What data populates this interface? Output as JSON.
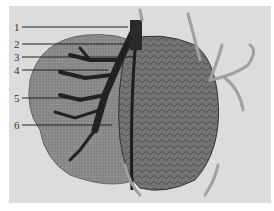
{
  "figure": {
    "colors": {
      "background": "#ffffff",
      "panel": "#dcdcdc",
      "left_lobe": "#8a8a8a",
      "right_lobe": "#6e6e6e",
      "vessels_dark": "#2a2a2a",
      "vessels_light": "#a8a8a8",
      "leader_line": "#222222"
    },
    "labels": [
      {
        "text": "1",
        "x": 14,
        "y": 22,
        "line_y": 27,
        "line_end_x": 128
      },
      {
        "text": "2",
        "x": 14,
        "y": 39,
        "line_y": 44,
        "line_end_x": 126
      },
      {
        "text": "3",
        "x": 14,
        "y": 52,
        "line_y": 57,
        "line_end_x": 133
      },
      {
        "text": "4",
        "x": 14,
        "y": 65,
        "line_y": 70,
        "line_end_x": 108
      },
      {
        "text": "5",
        "x": 14,
        "y": 93,
        "line_y": 98,
        "line_end_x": 82
      },
      {
        "text": "6",
        "x": 14,
        "y": 120,
        "line_y": 125,
        "line_end_x": 112
      }
    ]
  }
}
